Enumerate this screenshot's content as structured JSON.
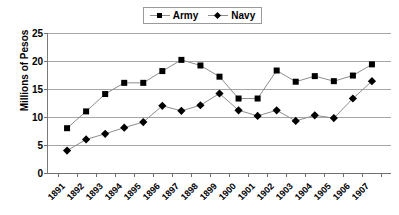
{
  "chart_data": {
    "type": "line",
    "title": "",
    "xlabel": "",
    "ylabel": "Millions of Pesos",
    "ylim": [
      0,
      25
    ],
    "ytick_step": 5,
    "yticks": [
      "0",
      "5",
      "10",
      "15",
      "20",
      "25"
    ],
    "grid": true,
    "legend_position": "top-center",
    "categories": [
      "1891",
      "1892",
      "1893",
      "1894",
      "1895",
      "1896",
      "1897",
      "1898",
      "1899",
      "1900",
      "1901",
      "1902",
      "1903",
      "1904",
      "1905",
      "1906",
      "1907"
    ],
    "series": [
      {
        "name": "Army",
        "marker": "square",
        "values": [
          8.0,
          11.0,
          14.1,
          16.1,
          16.1,
          18.2,
          20.2,
          19.2,
          17.2,
          13.3,
          13.3,
          18.3,
          16.3,
          17.3,
          16.4,
          17.4,
          19.4
        ]
      },
      {
        "name": "Navy",
        "marker": "diamond",
        "values": [
          4.0,
          6.0,
          7.0,
          8.1,
          9.1,
          12.0,
          11.1,
          12.1,
          14.2,
          11.2,
          10.2,
          11.2,
          9.3,
          10.3,
          9.8,
          13.3,
          16.4
        ]
      }
    ],
    "colors": {
      "marker": "#000000",
      "line": "#8d8d8d",
      "gridline": "#a6a6a6",
      "axis": "#6f6f6f",
      "background": "#ffffff"
    }
  },
  "legend": {
    "items": [
      {
        "label": "Army",
        "marker": "square"
      },
      {
        "label": "Navy",
        "marker": "diamond"
      }
    ]
  }
}
